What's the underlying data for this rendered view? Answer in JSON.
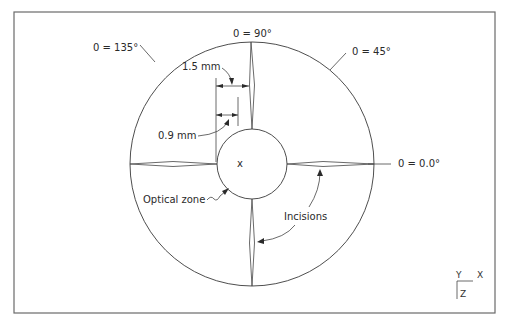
{
  "diagram": {
    "type": "radial keratotomy incision schematic",
    "labels": {
      "angle_90": "0 = 90°",
      "angle_135": "0 = 135°",
      "angle_45": "0 = 45°",
      "angle_0": "0 = 0.0°",
      "dim_outer": "1.5 mm",
      "dim_inner": "0.9 mm",
      "optical_zone": "Optical zone",
      "incisions": "Incisions",
      "center_mark": "x"
    },
    "axes_triad": {
      "y": "Y",
      "x": "X",
      "z": "Z"
    },
    "geometry": {
      "center": [
        252,
        164
      ],
      "outer_radius": 122,
      "optical_zone_radius": 35,
      "incision_count": 4,
      "incision_angles_deg": [
        0,
        90,
        180,
        270
      ]
    },
    "colors": {
      "line": "#3a3a3a",
      "frame": "#6a6a6a",
      "background": "#ffffff"
    }
  }
}
